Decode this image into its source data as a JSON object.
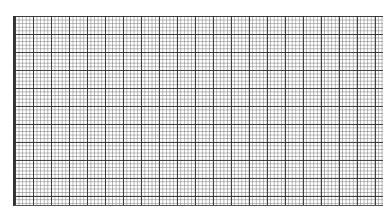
{
  "image": {
    "description": "graph paper grid",
    "major_cell_px": 18,
    "minor_divisions": 5,
    "line_color": "#333333",
    "background": "#ffffff"
  }
}
